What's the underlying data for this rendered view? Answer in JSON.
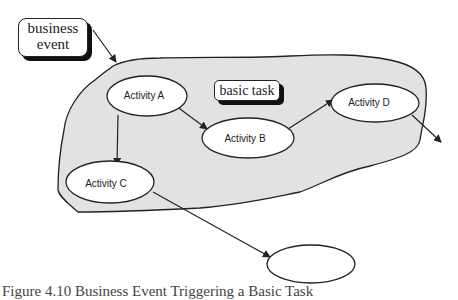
{
  "diagram": {
    "callouts": {
      "business_event": {
        "line1": "business",
        "line2": "event"
      },
      "basic_task": "basic task"
    },
    "activities": [
      {
        "id": "A",
        "label": "Activity A"
      },
      {
        "id": "B",
        "label": "Activity B"
      },
      {
        "id": "C",
        "label": "Activity C"
      },
      {
        "id": "D",
        "label": "Activity D"
      },
      {
        "id": "E",
        "label": ""
      }
    ],
    "edges": [
      {
        "from": "business_event",
        "to": "basic_task_region"
      },
      {
        "from": "A",
        "to": "B"
      },
      {
        "from": "A",
        "to": "C"
      },
      {
        "from": "B",
        "to": "D"
      },
      {
        "from": "D",
        "to": "outside"
      },
      {
        "from": "C",
        "to": "E"
      }
    ],
    "colors": {
      "region_fill": "#e2e2e2",
      "stroke": "#222222",
      "shadow": "#111111"
    }
  },
  "caption": "Figure 4.10  Business Event Triggering a Basic Task"
}
